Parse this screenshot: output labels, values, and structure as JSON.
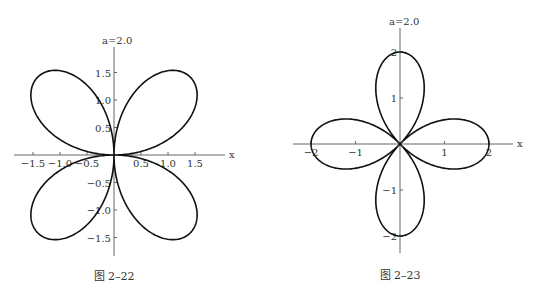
{
  "page": {
    "top_text": "......"
  },
  "chart_data": [
    {
      "type": "line",
      "subtype": "polar-rose",
      "title": "a=2.0",
      "caption": "图 2–22",
      "equation_hint": "r = a·sin(2θ), a = 2.0",
      "xlabel": "x",
      "ylabel": "",
      "x_ticks": [
        "-1.5",
        "-1.0",
        "-0.5",
        "0.5",
        "1.0",
        "1.5"
      ],
      "y_ticks": [
        "1.5",
        "1.0",
        "0.5",
        "-0.5",
        "-1.0",
        "-1.5"
      ],
      "xlim": [
        -1.85,
        2.1
      ],
      "ylim": [
        -1.85,
        2.0
      ],
      "grid": false,
      "petals": 4,
      "petal_directions_deg": [
        45,
        135,
        225,
        315
      ],
      "max_radius": 2.0
    },
    {
      "type": "line",
      "subtype": "polar-rose",
      "title": "a=2.0",
      "caption": "图 2–23",
      "equation_hint": "r = a·cos(2θ), a = 2.0",
      "xlabel": "x",
      "ylabel": "",
      "x_ticks": [
        "-2",
        "-1",
        "1",
        "2"
      ],
      "y_ticks": [
        "2",
        "1",
        "-1",
        "-2"
      ],
      "xlim": [
        -2.4,
        2.4
      ],
      "ylim": [
        -2.4,
        2.5
      ],
      "grid": false,
      "petals": 4,
      "petal_directions_deg": [
        0,
        90,
        180,
        270
      ],
      "max_radius": 2.0
    }
  ]
}
